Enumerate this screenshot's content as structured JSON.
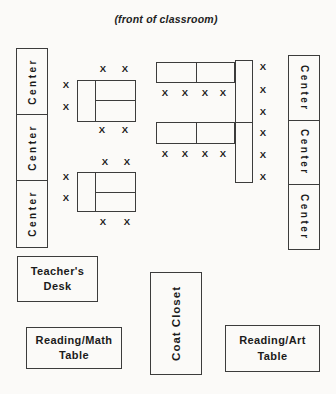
{
  "title": "(front of classroom)",
  "seat_marker": "X",
  "centers_left": [
    {
      "label": "Center"
    },
    {
      "label": "Center"
    },
    {
      "label": "Center"
    }
  ],
  "centers_right": [
    {
      "label": "Center"
    },
    {
      "label": "Center"
    },
    {
      "label": "Center"
    }
  ],
  "teachers_desk": {
    "line1": "Teacher's",
    "line2": "Desk"
  },
  "reading_math_table": {
    "line1": "Reading/Math",
    "line2": "Table"
  },
  "coat_closet": {
    "label": "Coat Closet"
  },
  "reading_art_table": {
    "line1": "Reading/Art",
    "line2": "Table"
  },
  "seats": [
    {
      "x": 103,
      "y": 69
    },
    {
      "x": 125,
      "y": 69
    },
    {
      "x": 66,
      "y": 85
    },
    {
      "x": 66,
      "y": 107
    },
    {
      "x": 102,
      "y": 130
    },
    {
      "x": 125,
      "y": 130
    },
    {
      "x": 105,
      "y": 162
    },
    {
      "x": 127,
      "y": 162
    },
    {
      "x": 66,
      "y": 177
    },
    {
      "x": 66,
      "y": 198
    },
    {
      "x": 103,
      "y": 222
    },
    {
      "x": 127,
      "y": 222
    },
    {
      "x": 165,
      "y": 93
    },
    {
      "x": 185,
      "y": 93
    },
    {
      "x": 205,
      "y": 93
    },
    {
      "x": 223,
      "y": 93
    },
    {
      "x": 165,
      "y": 154
    },
    {
      "x": 185,
      "y": 154
    },
    {
      "x": 205,
      "y": 154
    },
    {
      "x": 223,
      "y": 154
    },
    {
      "x": 263,
      "y": 67
    },
    {
      "x": 263,
      "y": 90
    },
    {
      "x": 263,
      "y": 112
    },
    {
      "x": 263,
      "y": 133
    },
    {
      "x": 263,
      "y": 155
    },
    {
      "x": 263,
      "y": 177
    }
  ],
  "colors": {
    "line": "#3c3c3c",
    "text": "#1b1b1b",
    "background": "#fbfaf8"
  }
}
